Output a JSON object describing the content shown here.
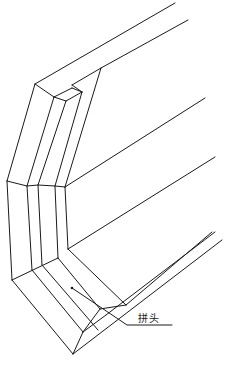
{
  "diagram": {
    "type": "isometric technical drawing",
    "annotations": [
      {
        "text": "拼头",
        "x": 138,
        "y": 312
      }
    ],
    "leader": {
      "from": [
        72,
        242
      ],
      "bend": [
        127,
        323
      ],
      "to": [
        172,
        323
      ]
    },
    "dot": [
      72,
      288
    ],
    "colors": {
      "line": "#1a1a1a",
      "background": "#ffffff"
    }
  }
}
